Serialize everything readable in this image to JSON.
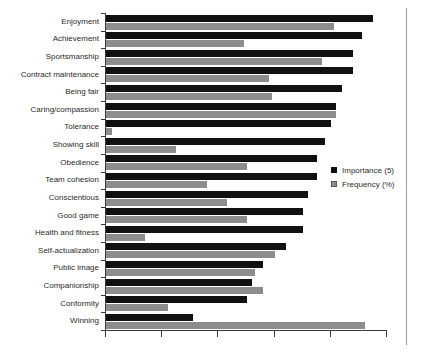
{
  "chart_data": {
    "type": "bar",
    "orientation": "horizontal",
    "title": "",
    "subtitle": "",
    "xlabel": "",
    "ylabel": "",
    "grid": false,
    "legend_position": "center-right",
    "xlim": [
      0,
      100
    ],
    "xticks_labeled": false,
    "xtick_count": 6,
    "categories": [
      "Enjoyment",
      "Achievement",
      "Sportsmanship",
      "Contract maintenance",
      "Being fair",
      "Caring/compassion",
      "Tolerance",
      "Showing skill",
      "Obedience",
      "Team cohesion",
      "Conscientious",
      "Good game",
      "Health and fitness",
      "Self-actualization",
      "Public image",
      "Companionship",
      "Conformity",
      "Winning"
    ],
    "series": [
      {
        "name": "Importance (5)",
        "color": "#111111",
        "values": [
          95,
          91,
          88,
          88,
          84,
          82,
          80,
          78,
          75,
          75,
          72,
          70,
          70,
          64,
          56,
          52,
          50,
          31
        ]
      },
      {
        "name": "Frequency (%)",
        "color": "#8d8d8d",
        "values": [
          81,
          49,
          77,
          58,
          59,
          82,
          2,
          25,
          50,
          36,
          43,
          50,
          14,
          60,
          53,
          56,
          22,
          92
        ]
      }
    ]
  },
  "legend": {
    "items": [
      {
        "label": "Importance (5)",
        "swatch": "black-square-icon"
      },
      {
        "label": "Frequency (%)",
        "swatch": "gray-square-icon"
      }
    ]
  }
}
